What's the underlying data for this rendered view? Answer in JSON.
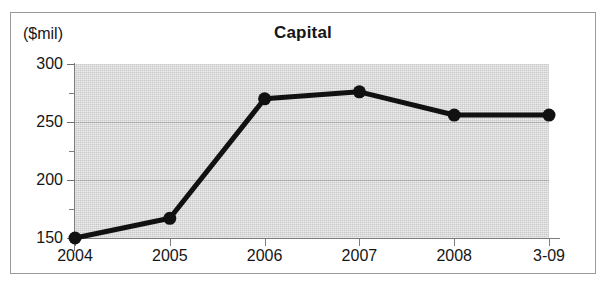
{
  "chart_data": {
    "type": "line",
    "title": "Capital",
    "xlabel": "",
    "ylabel": "($mil)",
    "categories": [
      "2004",
      "2005",
      "2006",
      "2007",
      "2008",
      "3-09"
    ],
    "values": [
      150,
      167,
      270,
      276,
      256,
      256
    ],
    "series": [
      {
        "name": "Capital",
        "values": [
          150,
          167,
          270,
          276,
          256,
          256
        ]
      }
    ],
    "ylim": [
      150,
      300
    ],
    "y_ticks": [
      150,
      200,
      250,
      300
    ],
    "y_tick_labels": [
      "150",
      "200",
      "250",
      "300"
    ],
    "y_minor_ticks": [
      175,
      225,
      275
    ],
    "grid": true,
    "legend": false,
    "legend_position": "none",
    "marker": "filled-circle",
    "line_color": "#111111",
    "plot_background": "#d8d8d8",
    "figure_background": "#ffffff"
  },
  "figure": {
    "title": "Capital",
    "unit_label": "($mil)"
  }
}
